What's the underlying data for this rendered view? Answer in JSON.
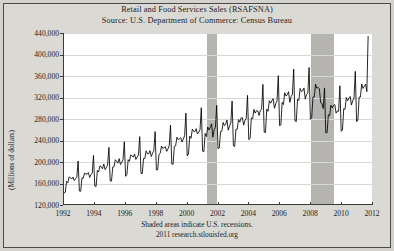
{
  "chart_data": {
    "type": "line",
    "title": "Retail and Food Services Sales (RSAFSNA)",
    "subtitle": "Source: U.S. Department of Commerce: Census Bureau",
    "xlabel": "",
    "ylabel": "(Millions of dollars)",
    "ylim": [
      120000,
      440000
    ],
    "xlim": [
      1992,
      2012
    ],
    "yticks": [
      "120,000",
      "160,000",
      "200,000",
      "240,000",
      "280,000",
      "320,000",
      "360,000",
      "400,000",
      "440,000"
    ],
    "ytick_values": [
      120000,
      160000,
      200000,
      240000,
      280000,
      320000,
      360000,
      400000,
      440000
    ],
    "xticks": [
      "1992",
      "1994",
      "1996",
      "1998",
      "2000",
      "2002",
      "2004",
      "2006",
      "2008",
      "2010",
      "2012"
    ],
    "xtick_values": [
      1992,
      1994,
      1996,
      1998,
      2000,
      2002,
      2004,
      2006,
      2008,
      2010,
      2012
    ],
    "grid": true,
    "legend": "none",
    "line_color": "#000000",
    "band_color": "#b6b4b0",
    "footnote": "Shaded areas indicate U.S. recessions.",
    "credit": "2011 research.stlouisfed.org",
    "recessions": [
      {
        "start": 2001.25,
        "end": 2001.92
      },
      {
        "start": 2007.99,
        "end": 2009.5
      }
    ],
    "x_start": 1992.0,
    "x_step": 0.0833333,
    "values": [
      141500,
      142800,
      163000,
      160500,
      171500,
      170000,
      167500,
      171000,
      164500,
      168000,
      170500,
      201000,
      145000,
      144500,
      169500,
      169000,
      178500,
      177000,
      176500,
      179500,
      170500,
      175500,
      178500,
      211500,
      154500,
      153500,
      183500,
      180500,
      192000,
      190500,
      186500,
      195500,
      185000,
      188500,
      193500,
      226500,
      164000,
      163500,
      190000,
      190500,
      203500,
      200500,
      197000,
      205500,
      194500,
      198500,
      203500,
      237000,
      172500,
      175500,
      203500,
      200500,
      212500,
      210500,
      208500,
      214000,
      204000,
      208500,
      212000,
      246500,
      178000,
      177500,
      206000,
      205500,
      220000,
      214500,
      214500,
      220500,
      209500,
      215500,
      220500,
      256000,
      184500,
      184500,
      213500,
      215500,
      229000,
      224500,
      226000,
      227500,
      219000,
      223500,
      229500,
      268000,
      195500,
      195000,
      228500,
      229500,
      245500,
      241000,
      242500,
      244500,
      236500,
      242000,
      248500,
      290500,
      210500,
      214000,
      247500,
      243500,
      260500,
      256500,
      256000,
      261500,
      251500,
      255000,
      259500,
      300500,
      219500,
      218500,
      252500,
      246500,
      264500,
      259000,
      263500,
      270500,
      245500,
      259500,
      264000,
      305000,
      224000,
      225500,
      256000,
      256500,
      273000,
      267000,
      270000,
      277500,
      258500,
      266500,
      272000,
      313000,
      229500,
      228000,
      260500,
      260500,
      278500,
      273500,
      281500,
      282000,
      268000,
      276500,
      280500,
      323500,
      241000,
      243000,
      281500,
      280000,
      297500,
      290500,
      295000,
      294500,
      286000,
      295500,
      297500,
      344000,
      254500,
      254500,
      298000,
      294000,
      313500,
      309000,
      313500,
      317500,
      299500,
      308000,
      313500,
      360500,
      267000,
      268500,
      310500,
      306500,
      328500,
      322500,
      324500,
      330500,
      310500,
      321500,
      325500,
      372500,
      276000,
      274500,
      316500,
      314000,
      336500,
      331000,
      332000,
      337500,
      316500,
      325500,
      327500,
      375500,
      279000,
      281500,
      320500,
      320500,
      344500,
      337000,
      338500,
      336000,
      310000,
      308500,
      299000,
      337500,
      253500,
      254000,
      287500,
      285500,
      305500,
      300000,
      304500,
      306500,
      290500,
      294500,
      294000,
      341500,
      256500,
      259000,
      299000,
      297500,
      319500,
      313500,
      318500,
      321500,
      305500,
      313500,
      318500,
      368500,
      274500,
      277500,
      320500,
      320500,
      345000,
      336500,
      340500,
      344500,
      330500,
      434500
    ]
  },
  "figure": {
    "background": "#d4d2cd",
    "plot_background": "#ffffff",
    "border_color": "#4a4a48"
  }
}
